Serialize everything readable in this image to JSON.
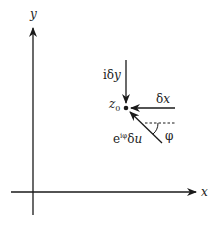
{
  "diagram": {
    "axes": {
      "x_label": "x",
      "y_label": "y"
    },
    "point": {
      "label_main": "z",
      "label_sub": "0"
    },
    "arrows": [
      {
        "id": "delta-y",
        "label_prefix": "iδ",
        "label_var": "y",
        "direction": "downward (from +y)"
      },
      {
        "id": "delta-x",
        "label_prefix": "δ",
        "label_var": "x",
        "direction": "leftward (from +x)"
      },
      {
        "id": "delta-u",
        "label_prefix": "e",
        "label_sup": "iφ",
        "label_mid": "δ",
        "label_var": "u",
        "direction": "at angle φ below horizontal"
      }
    ],
    "angle": {
      "label": "φ"
    },
    "colors": {
      "stroke": "#1a1a1a",
      "background": "#ffffff"
    }
  }
}
